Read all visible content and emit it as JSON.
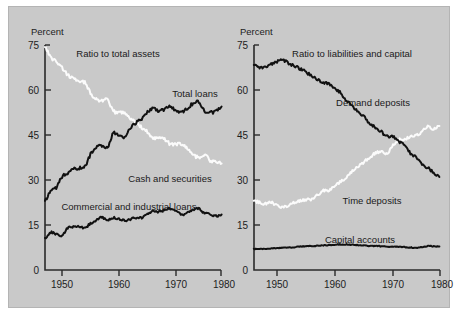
{
  "figure": {
    "background_color": "#c9c9c9",
    "page_color": "#ffffff",
    "dark_series_color": "#111111",
    "light_series_color": "#fbfbfb"
  },
  "chart_data": [
    {
      "type": "line",
      "panel": "left",
      "title": "",
      "annotation": "Ratio to total assets",
      "ylabel": "Percent",
      "xlabel": "",
      "ylim": [
        0,
        75
      ],
      "xlim": [
        1947,
        1978
      ],
      "yticks": [
        0,
        15,
        30,
        45,
        60,
        75
      ],
      "ytick_labels": [
        "0",
        "15",
        "30",
        "45",
        "60",
        "75"
      ],
      "xticks": [
        1950,
        1960,
        1970,
        1980
      ],
      "xtick_labels": [
        "1950",
        "1960",
        "1970",
        "1980"
      ],
      "grid": false,
      "legend_position": "inline-annotation",
      "x": [
        1947,
        1948,
        1949,
        1950,
        1951,
        1952,
        1953,
        1954,
        1955,
        1956,
        1957,
        1958,
        1959,
        1960,
        1961,
        1962,
        1963,
        1964,
        1965,
        1966,
        1967,
        1968,
        1969,
        1970,
        1971,
        1972,
        1973,
        1974,
        1975,
        1976,
        1977,
        1978
      ],
      "series": [
        {
          "name": "Cash and securities",
          "color": "#fbfbfb",
          "style": "light",
          "values": [
            74.5,
            71.0,
            69.5,
            67.5,
            65.0,
            64.0,
            62.5,
            62.5,
            59.0,
            57.0,
            56.5,
            56.5,
            53.0,
            52.5,
            52.5,
            50.5,
            49.0,
            47.5,
            46.0,
            44.0,
            44.5,
            43.5,
            42.0,
            42.0,
            42.0,
            40.5,
            38.5,
            37.5,
            38.5,
            36.5,
            36.0,
            35.5
          ]
        },
        {
          "name": "Total loans",
          "color": "#111111",
          "style": "dark",
          "values": [
            23.0,
            26.5,
            27.5,
            31.0,
            32.0,
            33.5,
            34.0,
            34.5,
            38.5,
            41.0,
            41.5,
            41.0,
            45.5,
            45.0,
            44.5,
            47.5,
            49.0,
            50.5,
            52.5,
            54.0,
            53.0,
            53.5,
            54.5,
            53.0,
            52.5,
            54.0,
            55.5,
            56.0,
            53.0,
            52.5,
            53.0,
            54.5
          ]
        },
        {
          "name": "Commercial and industrial loans",
          "color": "#111111",
          "style": "dark",
          "values": [
            10.5,
            12.5,
            12.0,
            11.5,
            14.0,
            14.5,
            14.5,
            14.0,
            15.5,
            16.5,
            17.5,
            16.5,
            17.5,
            17.0,
            16.5,
            17.0,
            17.5,
            17.5,
            18.5,
            19.5,
            19.5,
            20.0,
            20.5,
            19.5,
            18.5,
            19.0,
            20.0,
            20.5,
            19.0,
            18.5,
            18.0,
            18.5
          ]
        }
      ]
    },
    {
      "type": "line",
      "panel": "right",
      "title": "",
      "annotation": "Ratio to liabilities and capital",
      "ylabel": "Percent",
      "xlabel": "",
      "ylim": [
        0,
        75
      ],
      "xlim": [
        1946,
        1978
      ],
      "yticks": [
        0,
        15,
        30,
        45,
        60,
        75
      ],
      "ytick_labels": [
        "0",
        "15",
        "30",
        "45",
        "60",
        "75"
      ],
      "xticks": [
        1950,
        1960,
        1970,
        1980
      ],
      "xtick_labels": [
        "1950",
        "1960",
        "1970",
        "1980"
      ],
      "grid": false,
      "legend_position": "inline-annotation",
      "x": [
        1946,
        1947,
        1948,
        1949,
        1950,
        1951,
        1952,
        1953,
        1954,
        1955,
        1956,
        1957,
        1958,
        1959,
        1960,
        1961,
        1962,
        1963,
        1964,
        1965,
        1966,
        1967,
        1968,
        1969,
        1970,
        1971,
        1972,
        1973,
        1974,
        1975,
        1976,
        1977,
        1978
      ],
      "series": [
        {
          "name": "Demand deposits",
          "color": "#111111",
          "style": "dark",
          "values": [
            68.5,
            67.5,
            68.0,
            68.5,
            69.5,
            70.0,
            69.0,
            68.0,
            67.0,
            66.0,
            64.5,
            63.5,
            62.5,
            62.0,
            60.5,
            59.0,
            56.5,
            54.5,
            53.0,
            51.0,
            49.0,
            47.5,
            46.0,
            44.5,
            44.5,
            43.0,
            41.5,
            39.0,
            37.5,
            35.5,
            34.0,
            32.5,
            31.0
          ]
        },
        {
          "name": "Time deposits",
          "color": "#fbfbfb",
          "style": "light",
          "values": [
            23.0,
            22.5,
            22.0,
            22.5,
            21.5,
            21.0,
            21.5,
            22.5,
            23.0,
            23.5,
            23.5,
            25.0,
            26.5,
            26.5,
            28.0,
            29.5,
            31.0,
            33.0,
            34.5,
            36.0,
            37.5,
            39.0,
            39.5,
            39.0,
            41.5,
            43.5,
            43.5,
            44.5,
            45.0,
            46.0,
            48.0,
            47.0,
            48.0
          ]
        },
        {
          "name": "Capital accounts",
          "color": "#111111",
          "style": "dark",
          "values": [
            7.0,
            7.0,
            7.0,
            7.2,
            7.3,
            7.4,
            7.5,
            7.6,
            7.8,
            7.9,
            8.0,
            8.1,
            8.2,
            8.3,
            8.4,
            8.5,
            8.5,
            8.4,
            8.3,
            8.2,
            8.0,
            8.0,
            7.9,
            7.8,
            7.7,
            7.8,
            7.6,
            7.5,
            7.4,
            7.6,
            8.0,
            7.9,
            7.8
          ]
        }
      ]
    }
  ],
  "left_panel": {
    "axis_label": "Percent",
    "annotation": "Ratio to total assets",
    "labels": {
      "total_loans": "Total loans",
      "cash_and_securities": "Cash and securities",
      "commercial_and_industrial_loans": "Commercial and industrial loans"
    },
    "ytick_labels": [
      "75",
      "60",
      "45",
      "30",
      "15",
      "0"
    ],
    "xtick_labels": [
      "1950",
      "1960",
      "1970",
      "1980"
    ]
  },
  "right_panel": {
    "axis_label": "Percent",
    "annotation": "Ratio to liabilities and capital",
    "labels": {
      "demand_deposits": "Demand deposits",
      "time_deposits": "Time deposits",
      "capital_accounts": "Capital accounts"
    },
    "ytick_labels": [
      "75",
      "60",
      "45",
      "30",
      "15",
      "0"
    ],
    "xtick_labels": [
      "1950",
      "1960",
      "1970",
      "1980"
    ]
  }
}
